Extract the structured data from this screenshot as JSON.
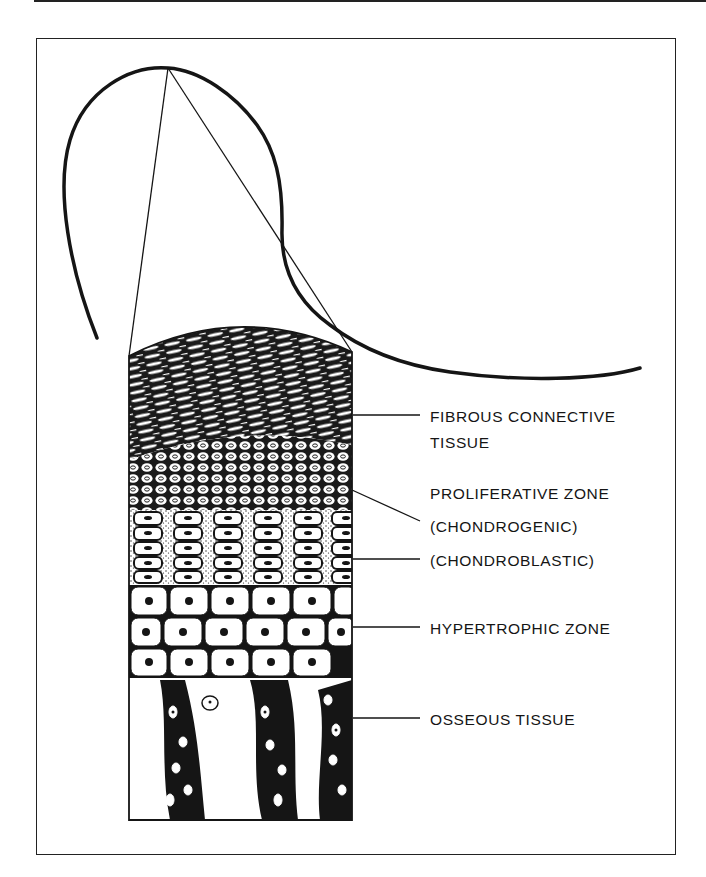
{
  "figure": {
    "labels": [
      {
        "id": "fibrous",
        "lines": [
          "FIBROUS CONNECTIVE",
          "TISSUE"
        ]
      },
      {
        "id": "proliferative",
        "lines": [
          "PROLIFERATIVE ZONE",
          "(CHONDROGENIC)"
        ]
      },
      {
        "id": "chondroblastic",
        "lines": [
          "(CHONDROBLASTIC)"
        ]
      },
      {
        "id": "hypertrophic",
        "lines": [
          "HYPERTROPHIC ZONE"
        ]
      },
      {
        "id": "osseous",
        "lines": [
          "OSSEOUS TISSUE"
        ]
      }
    ],
    "colors": {
      "ink": "#151515",
      "paper": "#ffffff"
    }
  }
}
